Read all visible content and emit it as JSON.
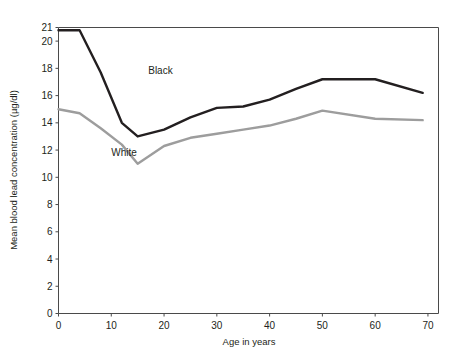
{
  "chart_data": {
    "type": "line",
    "title": "",
    "xlabel": "Age in years",
    "ylabel": "Mean blood lead concentration (µg/dl)",
    "xlim": [
      0,
      72
    ],
    "ylim": [
      0,
      21
    ],
    "grid": false,
    "legend_position": "inline-annotation",
    "xticks": [
      0,
      10,
      20,
      30,
      40,
      50,
      60,
      70
    ],
    "xtick_labels": [
      "0",
      "10",
      "20",
      "30",
      "40",
      "50",
      "60",
      "70"
    ],
    "yticks": [
      0,
      2,
      4,
      6,
      8,
      10,
      12,
      14,
      16,
      18,
      20,
      21
    ],
    "ytick_labels": [
      "0",
      "2",
      "4",
      "6",
      "8",
      "10",
      "12",
      "14",
      "16",
      "18",
      "20",
      "21"
    ],
    "series": [
      {
        "name": "Black",
        "color": "#231f20",
        "stroke_width": 2.4,
        "label_x": 17,
        "label_y": 17.6,
        "x": [
          0,
          4,
          8,
          12,
          15,
          20,
          25,
          30,
          35,
          40,
          45,
          50,
          60,
          69
        ],
        "values": [
          20.8,
          20.8,
          17.7,
          14.0,
          13.0,
          13.5,
          14.4,
          15.1,
          15.2,
          15.7,
          16.5,
          17.2,
          17.2,
          16.2
        ]
      },
      {
        "name": "White",
        "color": "#9d9d9d",
        "stroke_width": 2.4,
        "label_x": 10,
        "label_y": 11.6,
        "x": [
          0,
          4,
          8,
          12,
          15,
          20,
          25,
          30,
          35,
          40,
          45,
          50,
          60,
          69
        ],
        "values": [
          15.0,
          14.7,
          13.6,
          12.4,
          11.0,
          12.3,
          12.9,
          13.2,
          13.5,
          13.8,
          14.3,
          14.9,
          14.3,
          14.2
        ]
      }
    ]
  }
}
